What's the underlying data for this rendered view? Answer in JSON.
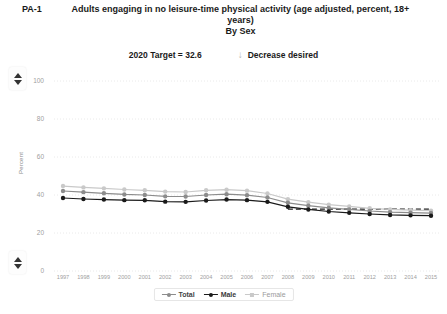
{
  "header": {
    "measure_id": "PA-1",
    "title_line1": "Adults engaging in no leisure-time physical activity (age adjusted, percent, 18+",
    "title_line2": "years)",
    "subtitle": "By Sex",
    "target_label": "2020 Target = 32.6",
    "direction_icon": "arrow-down-icon",
    "direction_label": "Decrease desired"
  },
  "controls": {
    "scroll_up_icon": "triangle-up-icon",
    "scroll_down_icon": "triangle-down-icon"
  },
  "legend": {
    "position": "bottom-center",
    "items": [
      {
        "label": "Total",
        "color": "#8c8c8c",
        "marker": "circle"
      },
      {
        "label": "Male",
        "color": "#1a1a1a",
        "marker": "circle"
      },
      {
        "label": "Female",
        "color": "#c9c9c9",
        "marker": "square"
      }
    ]
  },
  "chart_data": {
    "type": "line",
    "title": "Adults engaging in no leisure-time physical activity (age adjusted, percent, 18+ years)",
    "subtitle": "By Sex",
    "xlabel": "",
    "ylabel": "Percent",
    "ylim": [
      0,
      100
    ],
    "yticks": [
      0,
      20,
      40,
      60,
      80,
      100
    ],
    "grid": true,
    "categories": [
      "1997",
      "1998",
      "1999",
      "2000",
      "2001",
      "2002",
      "2003",
      "2004",
      "2005",
      "2006",
      "2007",
      "2008",
      "2009",
      "2010",
      "2011",
      "2012",
      "2013",
      "2014",
      "2015"
    ],
    "series": [
      {
        "name": "Total",
        "color": "#8c8c8c",
        "values": [
          42.1,
          41.5,
          40.9,
          40.3,
          40.0,
          39.3,
          39.2,
          40.0,
          40.4,
          39.9,
          38.7,
          35.9,
          34.4,
          33.2,
          32.4,
          31.6,
          31.0,
          30.7,
          30.5
        ]
      },
      {
        "name": "Male",
        "color": "#1a1a1a",
        "values": [
          38.4,
          37.9,
          37.6,
          37.3,
          37.2,
          36.5,
          36.4,
          37.1,
          37.6,
          37.3,
          36.4,
          33.8,
          32.4,
          31.3,
          30.6,
          30.0,
          29.5,
          29.3,
          29.1
        ]
      },
      {
        "name": "Female",
        "color": "#c9c9c9",
        "values": [
          44.7,
          44.0,
          43.5,
          42.9,
          42.5,
          41.8,
          41.6,
          42.5,
          42.8,
          42.3,
          40.8,
          37.8,
          36.2,
          34.9,
          34.0,
          33.0,
          32.4,
          32.0,
          31.8
        ]
      }
    ],
    "target_line": {
      "label": "2020 Target = 32.6",
      "value": 32.6,
      "style": "dashed",
      "color": "#1a1a1a",
      "start_category": "2008",
      "end_category": "2015"
    }
  }
}
